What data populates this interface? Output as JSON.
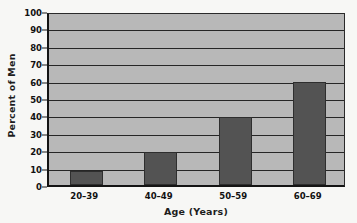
{
  "chart_data": {
    "type": "bar",
    "title": "",
    "categories": [
      "20–39",
      "40–49",
      "50–59",
      "60–69"
    ],
    "values": [
      8,
      19,
      39,
      59
    ],
    "xlabel": "Age (Years)",
    "ylabel": "Percent of Men",
    "ylim": [
      0,
      100
    ],
    "ytick_labels": [
      "0",
      "10",
      "20",
      "30",
      "40",
      "50",
      "60",
      "70",
      "80",
      "90",
      "100"
    ],
    "ytick_values": [
      0,
      10,
      20,
      30,
      40,
      50,
      60,
      70,
      80,
      90,
      100
    ],
    "grid": "horizontal",
    "legend": "none",
    "colors": {
      "bar_fill": "#535353",
      "bar_edge": "#2e2e2e",
      "plot_background": "#b8b8b8",
      "gridline": "#262626",
      "axis": "#141414",
      "text": "#111111",
      "page_background": "#f7f7f5"
    }
  }
}
